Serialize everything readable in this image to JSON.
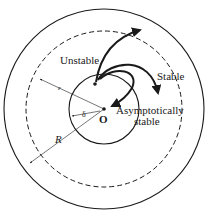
{
  "diagram": {
    "labels": {
      "unstable": "Unstable",
      "stable": "Stable",
      "asymptotic_line1": "Asymptotically",
      "asymptotic_line2": "stable",
      "origin": "O",
      "epsilon": "ε",
      "delta": "δ",
      "radius": "R"
    },
    "circles": [
      {
        "name": "outer-region-R",
        "style": "solid",
        "radius": 100
      },
      {
        "name": "epsilon-region",
        "style": "dashed",
        "radius": 78
      },
      {
        "name": "delta-region",
        "style": "solid",
        "radius": 35
      }
    ],
    "colors": {
      "stroke": "#1a1a1a",
      "background": "#ffffff"
    }
  }
}
